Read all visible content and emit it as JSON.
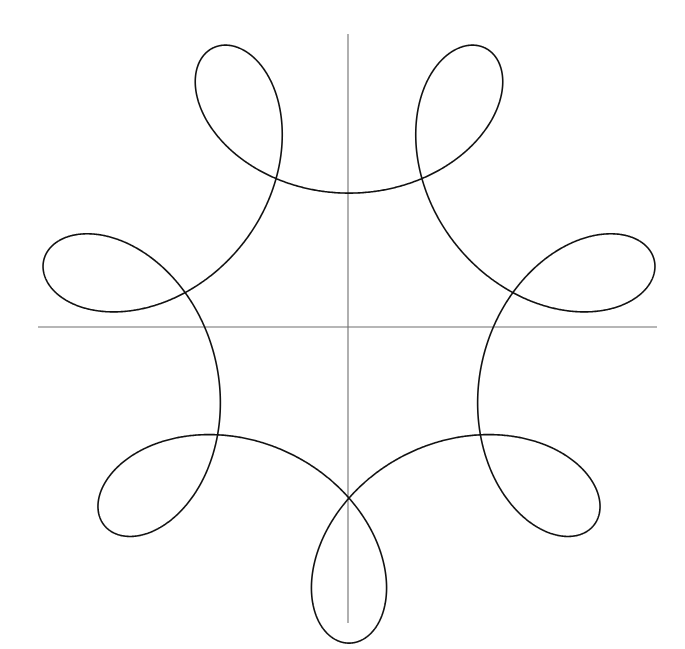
{
  "figure": {
    "title": "",
    "background_color": "#ffffff",
    "width": 685,
    "height": 649
  },
  "axes": {
    "name": "cartesian-axes",
    "color": "#6e6e6e",
    "line_width": 1.1,
    "origin": {
      "x": 348,
      "y": 327
    },
    "x_axis": {
      "label": "",
      "x1": 38,
      "y1": 327,
      "x2": 657,
      "y2": 327
    },
    "y_axis": {
      "label": "",
      "x1": 348,
      "y1": 34,
      "x2": 348,
      "y2": 623
    },
    "tick_labels": [],
    "grid": false
  },
  "chart_data": {
    "type": "line",
    "title": "",
    "xlabel": "",
    "ylabel": "",
    "curve_family": "hypotrochoid",
    "equation": "x(t) = (R - r)·cos(t) + d·cos(((R - r)/r)·t),  y(t) = (R - r)·sin(t) - d·sin(((R - r)/r)·t)",
    "parameters": {
      "R": 7,
      "r": 1,
      "d": 2.35,
      "t_start": 0,
      "t_end": 6.283185307179586,
      "samples": 4000,
      "rotation_deg": -90,
      "scale_px_per_unit": 37.5
    },
    "symmetry_order": 6,
    "inner_node_count": 6,
    "outer_loop_count": 6,
    "petal_loop_count": 12,
    "center_px": {
      "x": 349,
      "y": 330
    },
    "inner_node_radius_px": 145,
    "outer_tip_radius_px": 300,
    "node_positions_px": [
      {
        "label": "node-top",
        "x": 342,
        "y": 188
      },
      {
        "label": "node-upper-right",
        "x": 473,
        "y": 252
      },
      {
        "label": "node-lower-right",
        "x": 478,
        "y": 393
      },
      {
        "label": "node-bottom",
        "x": 357,
        "y": 472
      },
      {
        "label": "node-lower-left",
        "x": 225,
        "y": 408
      },
      {
        "label": "node-upper-left",
        "x": 220,
        "y": 265
      }
    ],
    "outer_tip_positions_px": [
      {
        "label": "tip-upper-right",
        "x": 452,
        "y": 72
      },
      {
        "label": "tip-right",
        "x": 636,
        "y": 280
      },
      {
        "label": "tip-lower-right",
        "x": 575,
        "y": 520
      },
      {
        "label": "tip-lower-left",
        "x": 275,
        "y": 590
      },
      {
        "label": "tip-left",
        "x": 70,
        "y": 388
      },
      {
        "label": "tip-upper-left",
        "x": 140,
        "y": 125
      }
    ],
    "legend": [],
    "annotations": [],
    "stroke_color": "#111111",
    "stroke_width": 1.6,
    "xlim": [
      -8.3,
      8.3
    ],
    "ylim": [
      -7.85,
      7.85
    ]
  }
}
